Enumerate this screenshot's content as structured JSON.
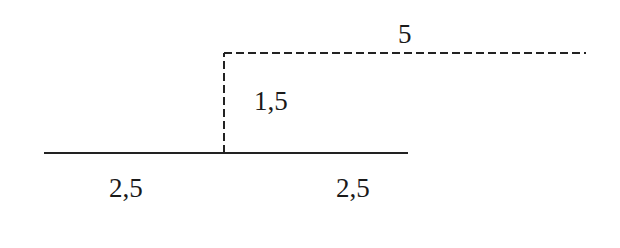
{
  "diagram": {
    "colors": {
      "background": "#ffffff",
      "line": "#222222",
      "text": "#1a1a1a"
    },
    "segments": [
      {
        "id": "base-left",
        "style": "solid",
        "from": [
          44,
          153
        ],
        "to": [
          224,
          153
        ]
      },
      {
        "id": "base-right",
        "style": "solid",
        "from": [
          224,
          153
        ],
        "to": [
          408,
          153
        ]
      },
      {
        "id": "riser",
        "style": "dashed",
        "from": [
          224,
          153
        ],
        "to": [
          224,
          53
        ]
      },
      {
        "id": "top",
        "style": "dashed",
        "from": [
          224,
          53
        ],
        "to": [
          586,
          53
        ]
      }
    ],
    "labels": {
      "top_length": "5",
      "riser_height": "1,5",
      "base_left_length": "2,5",
      "base_right_length": "2,5"
    }
  }
}
